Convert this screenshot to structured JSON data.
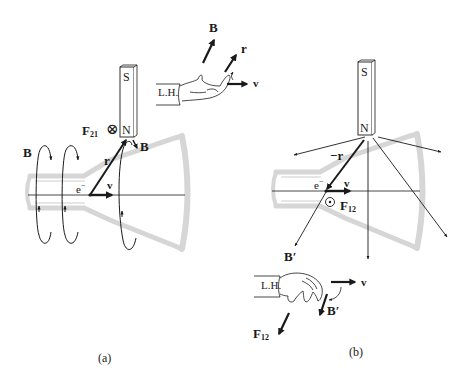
{
  "figure": {
    "colors": {
      "ink": "#1a1a1a",
      "tube": "#d8d8d8",
      "background": "#ffffff"
    }
  },
  "panel_a": {
    "caption": "(a)",
    "magnet": {
      "top_pole": "S",
      "bottom_pole": "N"
    },
    "force_label": "F",
    "force_subscript": "21",
    "force_symbol": "⊗",
    "field_label_left": "B",
    "field_label_magnet": "B",
    "electron_label": "e",
    "electron_charge": "−",
    "velocity_label": "v",
    "position_label": "r",
    "hand": {
      "label": "L.H.",
      "field_label": "B",
      "position_label": "r",
      "velocity_label": "v"
    }
  },
  "panel_b": {
    "caption": "(b)",
    "magnet": {
      "top_pole": "S",
      "bottom_pole": "N"
    },
    "position_label": "−r",
    "electron_label": "e",
    "electron_charge": "−",
    "velocity_label": "v",
    "force_symbol": "⊙",
    "force_label": "F",
    "force_subscript": "12",
    "field_label": "B′",
    "hand": {
      "label": "L.H.",
      "velocity_label": "v",
      "field_label": "B′",
      "force_label": "F",
      "force_subscript": "12"
    }
  }
}
